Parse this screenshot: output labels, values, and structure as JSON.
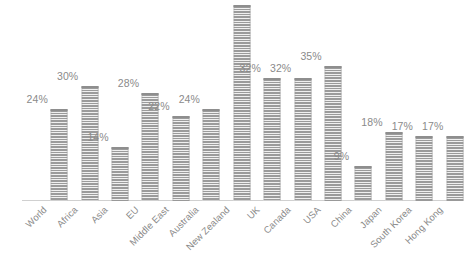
{
  "chart_data": {
    "type": "bar",
    "title": "",
    "subtitle": "",
    "xlabel": "",
    "ylabel": "",
    "grid": false,
    "legend": "none",
    "ylim": [
      0,
      52
    ],
    "axis_visible": {
      "x_axis_line": true,
      "y_axis_line": false,
      "y_tick_labels": false
    },
    "categories": [
      "World",
      "Africa",
      "Asia",
      "EU",
      "Middle East",
      "Australia",
      "New Zealand",
      "UK",
      "Canada",
      "USA",
      "China",
      "Japan",
      "South Korea",
      "Hong Kong"
    ],
    "values": [
      24,
      30,
      14,
      28,
      22,
      24,
      52,
      32,
      32,
      35,
      9,
      18,
      17,
      17
    ],
    "data_labels": [
      "24%",
      "30%",
      "14%",
      "28%",
      "22%",
      "24%",
      "",
      "32%",
      "32%",
      "35%",
      "9%",
      "18%",
      "17%",
      "17%"
    ],
    "colors": {
      "bar_fill": "#9b9b9b",
      "bar_hatch": "#ffffff",
      "axis_line": "#d0d0d0",
      "label_text": "#8a8a8a",
      "background": "#ffffff"
    }
  }
}
